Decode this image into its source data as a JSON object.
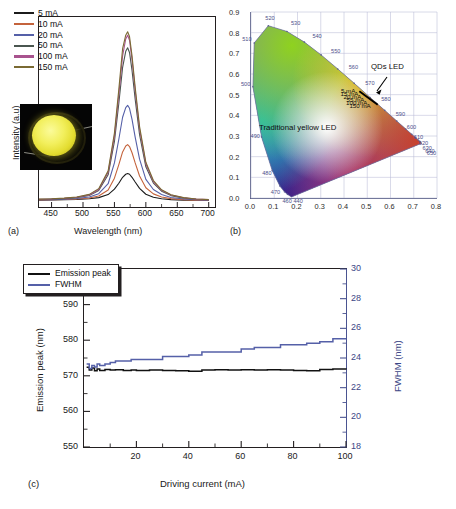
{
  "figure": {
    "panels": [
      {
        "tag": "(a)"
      },
      {
        "tag": "(b)"
      },
      {
        "tag": "(c)"
      }
    ]
  },
  "panel_a": {
    "tag": "(a)",
    "xlabel": "Wavelength (nm)",
    "ylabel": "Intensity (a.u)",
    "xticks": [
      "450",
      "500",
      "550",
      "600",
      "650",
      "700"
    ],
    "legend": [
      {
        "label": "5 mA",
        "color": "#1b1b1b"
      },
      {
        "label": "10 mA",
        "color": "#c4633c"
      },
      {
        "label": "20 mA",
        "color": "#5560a8"
      },
      {
        "label": "50 mA",
        "color": "#4a5650"
      },
      {
        "label": "100 mA",
        "color": "#a8538e"
      },
      {
        "label": "150 mA",
        "color": "#7a6a33"
      }
    ],
    "inset_alt": "Photograph of lit yellow QD LED package"
  },
  "panel_b": {
    "tag": "(b)",
    "xticks": [
      "0.0",
      "0.1",
      "0.2",
      "0.3",
      "0.4",
      "0.5",
      "0.6",
      "0.7",
      "0.8"
    ],
    "yticks": [
      "0.0",
      "0.1",
      "0.2",
      "0.3",
      "0.4",
      "0.5",
      "0.6",
      "0.7",
      "0.8",
      "0.9"
    ],
    "locus_labels": [
      "480",
      "490",
      "500",
      "510",
      "520",
      "530",
      "540",
      "550",
      "560",
      "570",
      "580",
      "590",
      "600",
      "610",
      "620",
      "630",
      "640",
      "650",
      "470",
      "460",
      "440"
    ],
    "annotations": [
      {
        "text": "QDs LED"
      },
      {
        "text": "Traditional yellow LED"
      }
    ],
    "current_labels": [
      "5 mA",
      "15 mA",
      "20 mA",
      "55 mA",
      "100 mA",
      "150 mA"
    ]
  },
  "panel_c": {
    "tag": "(c)",
    "xlabel": "Driving current (mA)",
    "ylabel_left": "Emission peak (nm)",
    "ylabel_right": "FWHM (nm)",
    "xticks": [
      "20",
      "40",
      "60",
      "80",
      "100"
    ],
    "yticks_left": [
      "550",
      "560",
      "570",
      "580",
      "590",
      "600"
    ],
    "yticks_right": [
      "18",
      "20",
      "22",
      "24",
      "26",
      "28",
      "30"
    ],
    "legend": [
      {
        "label": "Emission peak",
        "color": "#111111"
      },
      {
        "label": "FWHM",
        "color": "#5560a8"
      }
    ]
  },
  "chart_data": [
    {
      "type": "line",
      "panel": "a",
      "title": "",
      "xlabel": "Wavelength (nm)",
      "ylabel": "Intensity (a.u)",
      "xlim": [
        430,
        710
      ],
      "ylim": [
        0,
        1.05
      ],
      "grid": false,
      "legend_position": "top-left",
      "x": [
        430,
        450,
        470,
        490,
        510,
        525,
        540,
        550,
        557,
        563,
        568,
        571,
        574,
        578,
        583,
        590,
        600,
        612,
        625,
        640,
        660,
        680,
        700
      ],
      "series": [
        {
          "name": "5 mA",
          "color": "#1b1b1b",
          "values": [
            0.005,
            0.006,
            0.007,
            0.009,
            0.013,
            0.02,
            0.038,
            0.07,
            0.105,
            0.14,
            0.158,
            0.162,
            0.158,
            0.14,
            0.112,
            0.075,
            0.04,
            0.022,
            0.013,
            0.008,
            0.005,
            0.004,
            0.003
          ]
        },
        {
          "name": "10 mA",
          "color": "#c4633c",
          "values": [
            0.006,
            0.007,
            0.009,
            0.012,
            0.018,
            0.03,
            0.065,
            0.135,
            0.215,
            0.29,
            0.325,
            0.333,
            0.322,
            0.285,
            0.225,
            0.148,
            0.078,
            0.042,
            0.024,
            0.014,
            0.008,
            0.005,
            0.004
          ]
        },
        {
          "name": "20 mA",
          "color": "#5560a8",
          "values": [
            0.007,
            0.008,
            0.011,
            0.015,
            0.024,
            0.043,
            0.102,
            0.225,
            0.365,
            0.495,
            0.552,
            0.565,
            0.548,
            0.482,
            0.378,
            0.247,
            0.128,
            0.068,
            0.038,
            0.021,
            0.012,
            0.007,
            0.005
          ]
        },
        {
          "name": "50 mA",
          "color": "#4a5650",
          "values": [
            0.009,
            0.011,
            0.014,
            0.02,
            0.033,
            0.062,
            0.155,
            0.352,
            0.578,
            0.79,
            0.885,
            0.906,
            0.878,
            0.772,
            0.602,
            0.392,
            0.202,
            0.106,
            0.058,
            0.032,
            0.017,
            0.01,
            0.007
          ]
        },
        {
          "name": "100 mA",
          "color": "#a8538e",
          "values": [
            0.01,
            0.012,
            0.016,
            0.022,
            0.036,
            0.068,
            0.168,
            0.382,
            0.628,
            0.858,
            0.958,
            0.98,
            0.95,
            0.836,
            0.652,
            0.424,
            0.219,
            0.115,
            0.063,
            0.035,
            0.019,
            0.011,
            0.008
          ]
        },
        {
          "name": "150 mA",
          "color": "#7a6a33",
          "values": [
            0.011,
            0.013,
            0.017,
            0.024,
            0.039,
            0.073,
            0.178,
            0.402,
            0.66,
            0.9,
            0.98,
            1.0,
            0.972,
            0.858,
            0.672,
            0.44,
            0.229,
            0.121,
            0.066,
            0.037,
            0.02,
            0.012,
            0.008
          ]
        }
      ]
    },
    {
      "type": "scatter",
      "panel": "b",
      "title": "CIE 1931 chromaticity diagram",
      "xlabel": "x",
      "ylabel": "y",
      "xlim": [
        0.0,
        0.8
      ],
      "ylim": [
        0.0,
        0.9
      ],
      "grid": true,
      "points": [
        {
          "label": "5 mA",
          "x": 0.466,
          "y": 0.517
        },
        {
          "label": "15 mA",
          "x": 0.482,
          "y": 0.505
        },
        {
          "label": "20 mA",
          "x": 0.497,
          "y": 0.492
        },
        {
          "label": "55 mA",
          "x": 0.513,
          "y": 0.478
        },
        {
          "label": "100 mA",
          "x": 0.528,
          "y": 0.465
        },
        {
          "label": "150 mA",
          "x": 0.545,
          "y": 0.451
        }
      ],
      "annotations": [
        "QDs LED",
        "Traditional yellow LED"
      ]
    },
    {
      "type": "line",
      "panel": "c",
      "title": "",
      "xlabel": "Driving current (mA)",
      "ylabel": "Emission peak (nm)",
      "ylabel_right": "FWHM (nm)",
      "xlim": [
        0,
        100
      ],
      "ylim": [
        550,
        600
      ],
      "ylim_right": [
        18,
        30
      ],
      "grid": false,
      "legend_position": "top-left",
      "x": [
        1,
        2,
        3,
        4,
        5,
        6,
        8,
        10,
        12,
        15,
        18,
        20,
        25,
        30,
        35,
        40,
        45,
        50,
        55,
        60,
        65,
        70,
        75,
        80,
        85,
        90,
        95,
        100
      ],
      "series": [
        {
          "name": "Emission peak",
          "axis": "left",
          "color": "#111111",
          "values": [
            572.4,
            571.6,
            572.2,
            571.4,
            571.9,
            571.5,
            571.8,
            571.6,
            571.7,
            571.5,
            571.6,
            571.5,
            571.6,
            571.5,
            571.4,
            571.3,
            571.6,
            571.7,
            571.6,
            571.7,
            571.6,
            571.7,
            571.6,
            571.5,
            571.4,
            571.8,
            571.9,
            571.8
          ]
        },
        {
          "name": "FWHM",
          "axis": "right",
          "color": "#5560a8",
          "values": [
            23.6,
            23.3,
            23.5,
            23.4,
            23.6,
            23.5,
            23.6,
            23.7,
            23.8,
            23.8,
            23.9,
            23.9,
            23.9,
            24.1,
            24.1,
            24.2,
            24.4,
            24.4,
            24.4,
            24.6,
            24.7,
            24.7,
            24.9,
            24.9,
            25.0,
            25.1,
            25.3,
            25.3
          ]
        }
      ]
    }
  ]
}
